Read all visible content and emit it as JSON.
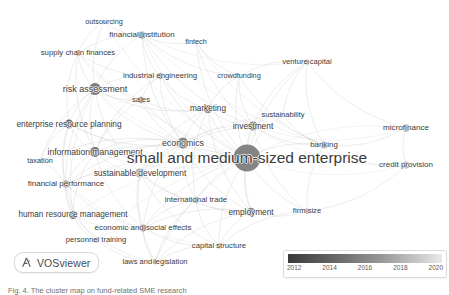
{
  "figure": {
    "tool_name": "VOSviewer",
    "logo_icon": "vosviewer-logo-icon",
    "caption": "Fig. 4. The cluster map on fund-related SME research"
  },
  "legend": {
    "name": "year-overlay-color-legend",
    "ticks": [
      "2012",
      "2014",
      "2016",
      "2018",
      "2020"
    ],
    "gradient_dark": "#3a3a3a",
    "gradient_light": "#eaeaea"
  },
  "chart_data": {
    "type": "scatter",
    "title": "",
    "xlabel": "",
    "ylabel": "",
    "grid": false,
    "legend_position": "bottom-right",
    "nodes": [
      {
        "label": "outsourcing",
        "x": 104,
        "y": 22,
        "r": 2.0,
        "year": 2014,
        "color": "#8d8d8d"
      },
      {
        "label": "financial institution",
        "x": 142,
        "y": 35,
        "r": 3.6,
        "year": 2016,
        "color": "#7b7b7b"
      },
      {
        "label": "fintech",
        "x": 196,
        "y": 42,
        "r": 1.8,
        "year": 2019,
        "color": "#b9b9b9"
      },
      {
        "label": "supply chain finances",
        "x": 78,
        "y": 53,
        "r": 3.0,
        "year": 2017,
        "color": "#909090"
      },
      {
        "label": "industrial engineering",
        "x": 160,
        "y": 76,
        "r": 3.0,
        "year": 2013,
        "color": "#6f6f6f"
      },
      {
        "label": "venture capital",
        "x": 307,
        "y": 62,
        "r": 2.6,
        "year": 2015,
        "color": "#8a8a8a"
      },
      {
        "label": "crowdfunding",
        "x": 239,
        "y": 76,
        "r": 2.0,
        "year": 2019,
        "color": "#bdbdbd"
      },
      {
        "label": "risk assessment",
        "x": 95,
        "y": 89,
        "r": 6.0,
        "year": 2014,
        "color": "#707070"
      },
      {
        "label": "sales",
        "x": 141,
        "y": 100,
        "r": 3.2,
        "year": 2013,
        "color": "#6b6b6b"
      },
      {
        "label": "marketing",
        "x": 208,
        "y": 109,
        "r": 4.0,
        "year": 2014,
        "color": "#737373"
      },
      {
        "label": "sustainability",
        "x": 283,
        "y": 115,
        "r": 2.4,
        "year": 2019,
        "color": "#c0c0c0"
      },
      {
        "label": "investment",
        "x": 253,
        "y": 126,
        "r": 4.6,
        "year": 2016,
        "color": "#7f7f7f"
      },
      {
        "label": "enterprise resource planning",
        "x": 69,
        "y": 124,
        "r": 4.4,
        "year": 2012,
        "color": "#606060"
      },
      {
        "label": "economics",
        "x": 183,
        "y": 143,
        "r": 5.4,
        "year": 2015,
        "color": "#787878"
      },
      {
        "label": "banking",
        "x": 324,
        "y": 145,
        "r": 3.4,
        "year": 2017,
        "color": "#959595"
      },
      {
        "label": "microfinance",
        "x": 406,
        "y": 128,
        "r": 3.8,
        "year": 2018,
        "color": "#a2a2a2"
      },
      {
        "label": "information management",
        "x": 95,
        "y": 152,
        "r": 5.0,
        "year": 2013,
        "color": "#6d6d6d"
      },
      {
        "label": "small and medium-sized enterprise",
        "x": 247,
        "y": 158,
        "r": 13.5,
        "year": 2016,
        "color": "#7a7a7a"
      },
      {
        "label": "taxation",
        "x": 40,
        "y": 161,
        "r": 1.8,
        "year": 2015,
        "color": "#949494"
      },
      {
        "label": "sustainable development",
        "x": 140,
        "y": 173,
        "r": 4.6,
        "year": 2018,
        "color": "#a8a8a8"
      },
      {
        "label": "credit provision",
        "x": 406,
        "y": 165,
        "r": 3.6,
        "year": 2018,
        "color": "#a6a6a6"
      },
      {
        "label": "financial performance",
        "x": 66,
        "y": 184,
        "r": 3.6,
        "year": 2016,
        "color": "#858585"
      },
      {
        "label": "international trade",
        "x": 196,
        "y": 200,
        "r": 3.0,
        "year": 2014,
        "color": "#7c7c7c"
      },
      {
        "label": "employment",
        "x": 251,
        "y": 212,
        "r": 4.2,
        "year": 2015,
        "color": "#7e7e7e"
      },
      {
        "label": "firm size",
        "x": 307,
        "y": 211,
        "r": 2.6,
        "year": 2017,
        "color": "#989898"
      },
      {
        "label": "human resource management",
        "x": 73,
        "y": 215,
        "r": 4.0,
        "year": 2013,
        "color": "#6e6e6e"
      },
      {
        "label": "economic and social effects",
        "x": 143,
        "y": 228,
        "r": 3.4,
        "year": 2016,
        "color": "#838383"
      },
      {
        "label": "personnel training",
        "x": 96,
        "y": 240,
        "r": 2.6,
        "year": 2013,
        "color": "#6f6f6f"
      },
      {
        "label": "capital structure",
        "x": 219,
        "y": 246,
        "r": 2.8,
        "year": 2017,
        "color": "#9c9c9c"
      },
      {
        "label": "laws and legislation",
        "x": 155,
        "y": 262,
        "r": 2.4,
        "year": 2015,
        "color": "#8b8b8b"
      }
    ],
    "edges": [
      [
        "outsourcing",
        "financial institution"
      ],
      [
        "outsourcing",
        "supply chain finances"
      ],
      [
        "outsourcing",
        "risk assessment"
      ],
      [
        "outsourcing",
        "small and medium-sized enterprise"
      ],
      [
        "financial institution",
        "fintech"
      ],
      [
        "financial institution",
        "supply chain finances"
      ],
      [
        "financial institution",
        "risk assessment"
      ],
      [
        "financial institution",
        "industrial engineering"
      ],
      [
        "financial institution",
        "small and medium-sized enterprise"
      ],
      [
        "financial institution",
        "investment"
      ],
      [
        "financial institution",
        "banking"
      ],
      [
        "financial institution",
        "economics"
      ],
      [
        "financial institution",
        "venture capital"
      ],
      [
        "financial institution",
        "crowdfunding"
      ],
      [
        "fintech",
        "small and medium-sized enterprise"
      ],
      [
        "fintech",
        "investment"
      ],
      [
        "fintech",
        "crowdfunding"
      ],
      [
        "fintech",
        "banking"
      ],
      [
        "supply chain finances",
        "risk assessment"
      ],
      [
        "supply chain finances",
        "small and medium-sized enterprise"
      ],
      [
        "supply chain finances",
        "enterprise resource planning"
      ],
      [
        "supply chain finances",
        "information management"
      ],
      [
        "supply chain finances",
        "industrial engineering"
      ],
      [
        "supply chain finances",
        "sales"
      ],
      [
        "industrial engineering",
        "risk assessment"
      ],
      [
        "industrial engineering",
        "sales"
      ],
      [
        "industrial engineering",
        "small and medium-sized enterprise"
      ],
      [
        "industrial engineering",
        "marketing"
      ],
      [
        "industrial engineering",
        "economics"
      ],
      [
        "industrial engineering",
        "information management"
      ],
      [
        "venture capital",
        "investment"
      ],
      [
        "venture capital",
        "small and medium-sized enterprise"
      ],
      [
        "venture capital",
        "crowdfunding"
      ],
      [
        "venture capital",
        "banking"
      ],
      [
        "venture capital",
        "sustainability"
      ],
      [
        "venture capital",
        "microfinance"
      ],
      [
        "crowdfunding",
        "investment"
      ],
      [
        "crowdfunding",
        "small and medium-sized enterprise"
      ],
      [
        "crowdfunding",
        "marketing"
      ],
      [
        "crowdfunding",
        "banking"
      ],
      [
        "risk assessment",
        "sales"
      ],
      [
        "risk assessment",
        "enterprise resource planning"
      ],
      [
        "risk assessment",
        "information management"
      ],
      [
        "risk assessment",
        "small and medium-sized enterprise"
      ],
      [
        "risk assessment",
        "economics"
      ],
      [
        "risk assessment",
        "marketing"
      ],
      [
        "risk assessment",
        "financial performance"
      ],
      [
        "risk assessment",
        "sustainable development"
      ],
      [
        "risk assessment",
        "human resource management"
      ],
      [
        "risk assessment",
        "taxation"
      ],
      [
        "sales",
        "marketing"
      ],
      [
        "sales",
        "small and medium-sized enterprise"
      ],
      [
        "sales",
        "economics"
      ],
      [
        "sales",
        "information management"
      ],
      [
        "marketing",
        "small and medium-sized enterprise"
      ],
      [
        "marketing",
        "investment"
      ],
      [
        "marketing",
        "economics"
      ],
      [
        "marketing",
        "sustainable development"
      ],
      [
        "marketing",
        "employment"
      ],
      [
        "marketing",
        "international trade"
      ],
      [
        "sustainability",
        "small and medium-sized enterprise"
      ],
      [
        "sustainability",
        "investment"
      ],
      [
        "sustainability",
        "sustainable development"
      ],
      [
        "sustainability",
        "banking"
      ],
      [
        "investment",
        "small and medium-sized enterprise"
      ],
      [
        "investment",
        "economics"
      ],
      [
        "investment",
        "banking"
      ],
      [
        "investment",
        "microfinance"
      ],
      [
        "investment",
        "credit provision"
      ],
      [
        "investment",
        "employment"
      ],
      [
        "investment",
        "sustainable development"
      ],
      [
        "investment",
        "firm size"
      ],
      [
        "enterprise resource planning",
        "information management"
      ],
      [
        "enterprise resource planning",
        "small and medium-sized enterprise"
      ],
      [
        "enterprise resource planning",
        "economics"
      ],
      [
        "enterprise resource planning",
        "financial performance"
      ],
      [
        "enterprise resource planning",
        "human resource management"
      ],
      [
        "enterprise resource planning",
        "taxation"
      ],
      [
        "economics",
        "small and medium-sized enterprise"
      ],
      [
        "economics",
        "information management"
      ],
      [
        "economics",
        "sustainable development"
      ],
      [
        "economics",
        "international trade"
      ],
      [
        "economics",
        "employment"
      ],
      [
        "economics",
        "economic and social effects"
      ],
      [
        "economics",
        "financial performance"
      ],
      [
        "economics",
        "taxation"
      ],
      [
        "banking",
        "small and medium-sized enterprise"
      ],
      [
        "banking",
        "microfinance"
      ],
      [
        "banking",
        "credit provision"
      ],
      [
        "banking",
        "firm size"
      ],
      [
        "microfinance",
        "small and medium-sized enterprise"
      ],
      [
        "microfinance",
        "credit provision"
      ],
      [
        "information management",
        "small and medium-sized enterprise"
      ],
      [
        "information management",
        "financial performance"
      ],
      [
        "information management",
        "human resource management"
      ],
      [
        "information management",
        "taxation"
      ],
      [
        "information management",
        "economic and social effects"
      ],
      [
        "information management",
        "sustainable development"
      ],
      [
        "small and medium-sized enterprise",
        "taxation"
      ],
      [
        "small and medium-sized enterprise",
        "sustainable development"
      ],
      [
        "small and medium-sized enterprise",
        "credit provision"
      ],
      [
        "small and medium-sized enterprise",
        "financial performance"
      ],
      [
        "small and medium-sized enterprise",
        "international trade"
      ],
      [
        "small and medium-sized enterprise",
        "employment"
      ],
      [
        "small and medium-sized enterprise",
        "firm size"
      ],
      [
        "small and medium-sized enterprise",
        "human resource management"
      ],
      [
        "small and medium-sized enterprise",
        "economic and social effects"
      ],
      [
        "small and medium-sized enterprise",
        "personnel training"
      ],
      [
        "small and medium-sized enterprise",
        "capital structure"
      ],
      [
        "small and medium-sized enterprise",
        "laws and legislation"
      ],
      [
        "sustainable development",
        "international trade"
      ],
      [
        "sustainable development",
        "employment"
      ],
      [
        "sustainable development",
        "economic and social effects"
      ],
      [
        "sustainable development",
        "financial performance"
      ],
      [
        "sustainable development",
        "capital structure"
      ],
      [
        "sustainable development",
        "laws and legislation"
      ],
      [
        "financial performance",
        "human resource management"
      ],
      [
        "financial performance",
        "economic and social effects"
      ],
      [
        "financial performance",
        "personnel training"
      ],
      [
        "financial performance",
        "capital structure"
      ],
      [
        "financial performance",
        "taxation"
      ],
      [
        "international trade",
        "employment"
      ],
      [
        "international trade",
        "economic and social effects"
      ],
      [
        "international trade",
        "capital structure"
      ],
      [
        "international trade",
        "laws and legislation"
      ],
      [
        "employment",
        "firm size"
      ],
      [
        "employment",
        "economic and social effects"
      ],
      [
        "employment",
        "capital structure"
      ],
      [
        "employment",
        "laws and legislation"
      ],
      [
        "firm size",
        "capital structure"
      ],
      [
        "firm size",
        "credit provision"
      ],
      [
        "human resource management",
        "economic and social effects"
      ],
      [
        "human resource management",
        "personnel training"
      ],
      [
        "human resource management",
        "laws and legislation"
      ],
      [
        "economic and social effects",
        "personnel training"
      ],
      [
        "economic and social effects",
        "laws and legislation"
      ],
      [
        "economic and social effects",
        "capital structure"
      ],
      [
        "personnel training",
        "laws and legislation"
      ],
      [
        "capital structure",
        "laws and legislation"
      ]
    ]
  }
}
